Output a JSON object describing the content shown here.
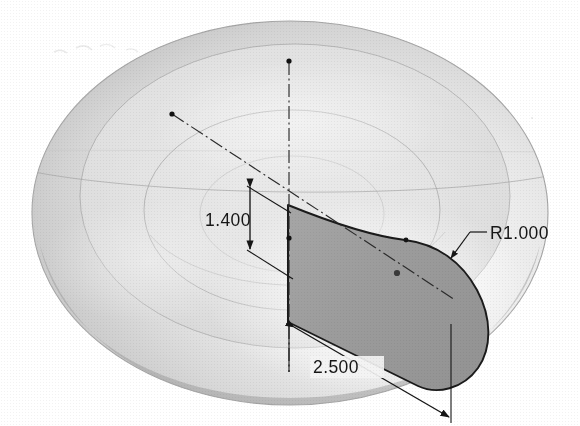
{
  "drawing": {
    "title_visible": false,
    "type": "cad-revolved-solid-isometric",
    "background_color": "#ffffff",
    "body": {
      "name": "revolved-lens-solid",
      "silhouette_fill_light": "#f2f2f2",
      "silhouette_fill_mid": "#dcdcdc",
      "silhouette_fill_dark": "#b9b9b9",
      "outline_color": "#9a9a9a"
    },
    "profile": {
      "name": "shaded-sketch-profile",
      "fill_color": "#9e9e9e",
      "outline_color": "#1b1b1b"
    },
    "annotation_color": "#161616",
    "centerline_color": "#2a2a2a"
  },
  "dimensions": [
    {
      "id": "height-dim",
      "label": "1.400",
      "value": 1.4,
      "kind": "linear-vertical",
      "text_x": 205,
      "text_y": 220
    },
    {
      "id": "length-dim",
      "label": "2.500",
      "value": 2.5,
      "kind": "linear-aligned",
      "text_x": 342,
      "text_y": 373
    },
    {
      "id": "fillet-radius",
      "label": "R1.000",
      "value": 1.0,
      "kind": "radius-leader",
      "text_x": 492,
      "text_y": 243
    }
  ],
  "icons": {
    "sketch_point": "point-marker",
    "arrowhead": "dimension-arrowhead"
  }
}
